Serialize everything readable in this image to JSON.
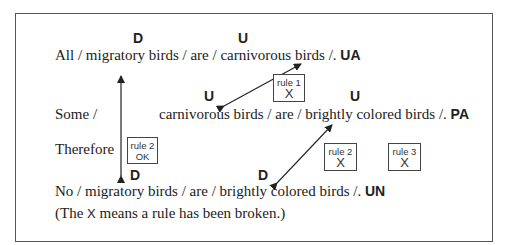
{
  "diagram": {
    "distribution_labels": {
      "line1_subject": "D",
      "line1_predicate": "U",
      "line2_subject": "U",
      "line2_predicate": "U",
      "line3_subject": "D",
      "line3_predicate": "D"
    },
    "premise_major": {
      "text": "All / migratory birds / are / carnivorous birds /.",
      "form": "UA"
    },
    "premise_minor": {
      "prefix": "Some /",
      "text": "carnivorous birds / are / brightly colored birds /.",
      "form": "PA"
    },
    "therefore_label": "Therefore",
    "conclusion": {
      "text": "No / migratory birds / are / brightly colored birds /.",
      "form": "UN"
    },
    "note": {
      "before": "(The ",
      "symbol": "X",
      "after": " means a rule has been broken.)"
    },
    "rule_boxes": [
      {
        "label": "rule 1",
        "status": "X"
      },
      {
        "label": "rule 2",
        "status": "OK"
      },
      {
        "label": "rule 2",
        "status": "X"
      },
      {
        "label": "rule 3",
        "status": "X"
      }
    ]
  }
}
